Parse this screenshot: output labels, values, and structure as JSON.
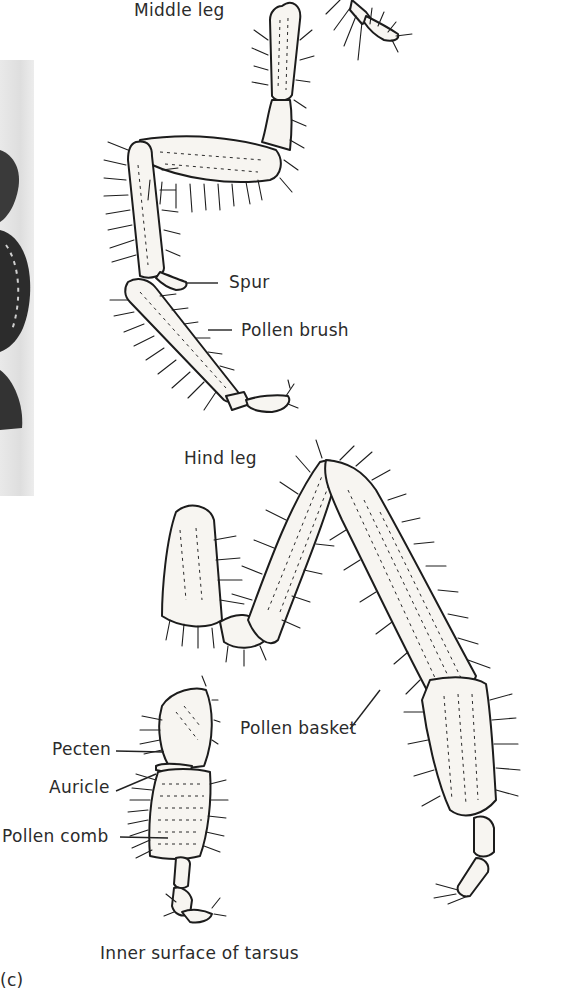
{
  "figure": {
    "panel_label": "(c)",
    "caption": "Inner surface of tarsus",
    "sections": {
      "middle_leg": "Middle leg",
      "hind_leg": "Hind leg"
    },
    "callouts": {
      "spur": "Spur",
      "pollen_brush": "Pollen brush",
      "pollen_basket": "Pollen basket",
      "pecten": "Pecten",
      "auricle": "Auricle",
      "pollen_comb": "Pollen comb"
    },
    "colors": {
      "ink": "#1c1c1c",
      "paper": "#ffffff",
      "photo_panel": "#e2e2e2"
    }
  }
}
